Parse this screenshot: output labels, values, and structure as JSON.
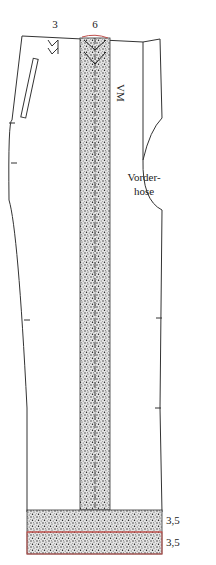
{
  "diagram": {
    "type": "sewing-pattern",
    "piece_label": "Vorderhose",
    "piece_label_lines": [
      "Vorder-",
      "hose"
    ],
    "marks": {
      "dart_width": "3",
      "center_strip_width": "6",
      "fly_mark": "VM"
    },
    "hem_measurements": [
      "3,5",
      "3,5"
    ],
    "colors": {
      "outline": "#333333",
      "stipple_fill": "#555555",
      "red_line": "#c0504d",
      "background": "#ffffff"
    }
  }
}
